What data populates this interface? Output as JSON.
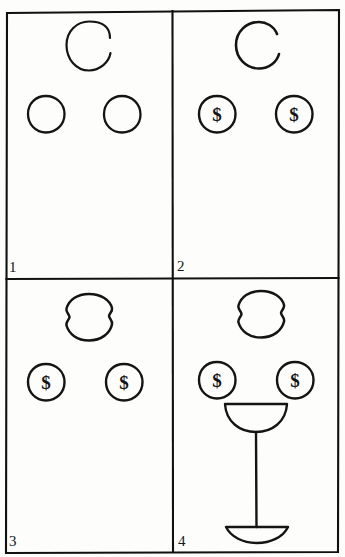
{
  "artwork": {
    "title": "Four-panel hand-drawn sketch sequence",
    "medium": "pen on paper",
    "background_color": "#fdfdfc",
    "ink_color": "#141414",
    "grid": {
      "columns": 2,
      "rows": 2,
      "panel_count": 4
    }
  },
  "panels": [
    {
      "number": "1",
      "number_position": "bottom-left",
      "caption": "",
      "elements": [
        {
          "name": "head-outline",
          "shape": "open-circle",
          "description": "nearly closed circle with a small gap on the right side",
          "position": "top-center",
          "cx": 89,
          "cy": 46,
          "rx": 22,
          "ry": 24
        },
        {
          "name": "left-eye-circle",
          "shape": "circle",
          "description": "plain empty circle",
          "position": "mid-left",
          "cx": 46,
          "cy": 114,
          "rx": 18,
          "ry": 18
        },
        {
          "name": "right-eye-circle",
          "shape": "circle",
          "description": "plain empty circle",
          "position": "mid-right",
          "cx": 122,
          "cy": 114,
          "rx": 18,
          "ry": 18
        }
      ]
    },
    {
      "number": "2",
      "number_position": "bottom-left",
      "caption": "",
      "elements": [
        {
          "name": "head-outline",
          "shape": "open-circle",
          "description": "circle with a wider gap on the right side",
          "position": "top-center",
          "cx": 259,
          "cy": 45,
          "rx": 23,
          "ry": 23
        },
        {
          "name": "left-eye-coin",
          "shape": "coin",
          "symbol": "$",
          "description": "circle containing a dollar sign",
          "position": "mid-left",
          "cx": 217,
          "cy": 114,
          "rx": 18,
          "ry": 18
        },
        {
          "name": "right-eye-coin",
          "shape": "coin",
          "symbol": "$",
          "description": "circle containing a dollar sign",
          "position": "mid-right",
          "cx": 294,
          "cy": 114,
          "rx": 18,
          "ry": 18
        }
      ]
    },
    {
      "number": "3",
      "number_position": "bottom-left",
      "caption": "",
      "elements": [
        {
          "name": "head-outline",
          "shape": "closed-blob",
          "description": "closed rounded blob with small pointed notches on left and right",
          "position": "top-center",
          "cx": 89,
          "cy": 317,
          "rx": 23,
          "ry": 23
        },
        {
          "name": "left-eye-coin",
          "shape": "coin",
          "symbol": "$",
          "description": "circle containing a dollar sign",
          "position": "mid-left",
          "cx": 46,
          "cy": 382,
          "rx": 18,
          "ry": 18
        },
        {
          "name": "right-eye-coin",
          "shape": "coin",
          "symbol": "$",
          "description": "circle containing a dollar sign",
          "position": "mid-right",
          "cx": 124,
          "cy": 382,
          "rx": 18,
          "ry": 18
        }
      ]
    },
    {
      "number": "4",
      "number_position": "bottom-left",
      "caption": "",
      "elements": [
        {
          "name": "head-outline",
          "shape": "closed-blob",
          "description": "closed rounded blob with small pointed notches on left and right",
          "position": "top-center",
          "cx": 261,
          "cy": 314,
          "rx": 23,
          "ry": 23
        },
        {
          "name": "left-eye-coin",
          "shape": "coin",
          "symbol": "$",
          "description": "circle containing a dollar sign",
          "position": "mid-left",
          "cx": 217,
          "cy": 380,
          "rx": 18,
          "ry": 18
        },
        {
          "name": "right-eye-coin",
          "shape": "coin",
          "symbol": "$",
          "description": "circle containing a dollar sign",
          "position": "mid-right",
          "cx": 295,
          "cy": 380,
          "rx": 18,
          "ry": 18
        },
        {
          "name": "cocktail-glass",
          "shape": "coupe-glass",
          "description": "half-circle bowl on a long stem with a domed foot",
          "position": "bottom-center",
          "bowl_cx": 256,
          "bowl_cy": 409,
          "bowl_rx": 31,
          "stem_bottom_y": 526,
          "foot_rx": 31
        }
      ]
    }
  ],
  "labels": {
    "dollar_symbol": "$",
    "panel_numbers": [
      "1",
      "2",
      "3",
      "4"
    ]
  }
}
